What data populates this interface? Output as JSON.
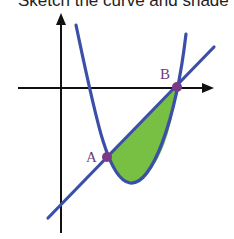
{
  "caption": "Sketch the curve and shade",
  "labels": {
    "point_a": "A",
    "point_b": "B"
  },
  "colors": {
    "axes": "#111111",
    "curve": "#3b4fa8",
    "line": "#3b4fa8",
    "shade": "#77c043",
    "points": "#7a3a8a"
  },
  "diagram": {
    "points": {
      "A": [
        107,
        157
      ],
      "B": [
        177,
        87
      ]
    }
  }
}
